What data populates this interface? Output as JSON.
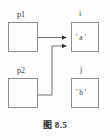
{
  "figure": {
    "caption": "图 8.5",
    "background_color": "#fdfdfd",
    "stroke_color": "#8d8d8d",
    "text_color": "#3a3a3a"
  },
  "nodes": {
    "p1": {
      "label": "p1",
      "content": ""
    },
    "p2": {
      "label": "p2",
      "content": ""
    },
    "i": {
      "label": "i",
      "content": "' a '"
    },
    "j": {
      "label": "j",
      "content": "' b '"
    }
  },
  "arrows": [
    {
      "from": "p1",
      "to": "i",
      "style": "orthogonal",
      "arrowhead": "filled-triangle"
    },
    {
      "from": "p2",
      "to": "i",
      "style": "orthogonal",
      "arrowhead": "filled-triangle"
    }
  ]
}
